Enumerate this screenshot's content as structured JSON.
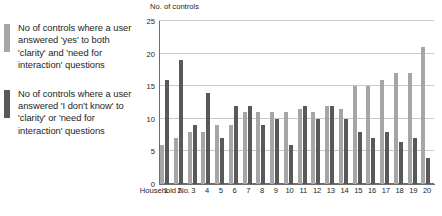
{
  "legend": {
    "items": [
      {
        "color": "#a6a6a6",
        "label": "No of controls where a user answered 'yes' to both 'clarity' and 'need for interaction' questions",
        "name": "legend-item-yes"
      },
      {
        "color": "#595959",
        "label": "No of controls where a user answered 'I don't know' to 'clarity' or 'need for interaction' questions",
        "name": "legend-item-dont-know"
      }
    ]
  },
  "axis": {
    "y_title": "No. of controls",
    "x_title": "Household  No."
  },
  "chart_data": {
    "type": "bar",
    "title": "",
    "subtitle": "",
    "xlabel": "Household  No.",
    "ylabel": "No. of controls",
    "ylim": [
      0,
      25
    ],
    "yticks": [
      0,
      5,
      10,
      15,
      20,
      25
    ],
    "grid": true,
    "legend_position": "left",
    "categories": [
      "1",
      "2",
      "3",
      "4",
      "5",
      "6",
      "7",
      "8",
      "9",
      "10",
      "11",
      "12",
      "13",
      "14",
      "15",
      "16",
      "17",
      "18",
      "19",
      "20"
    ],
    "series": [
      {
        "name": "No of controls where a user answered 'yes' to both 'clarity' and 'need for interaction' questions",
        "color": "#a6a6a6",
        "values": [
          6,
          7,
          8,
          8,
          9,
          9,
          11,
          11,
          11,
          11,
          11.5,
          11,
          12,
          11.5,
          15,
          15,
          16,
          17,
          17,
          21
        ]
      },
      {
        "name": "No of controls where a user answered 'I don't know' to 'clarity' or 'need for interaction' questions",
        "color": "#595959",
        "values": [
          16,
          19,
          9,
          14,
          7,
          12,
          12,
          9,
          10,
          6,
          12,
          10,
          12,
          10,
          8,
          7,
          8,
          6.5,
          7,
          4
        ]
      }
    ]
  }
}
